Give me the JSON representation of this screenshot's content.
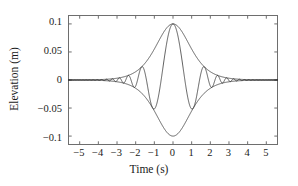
{
  "figure": {
    "background_color": "#ffffff",
    "frame_color": "#6e6e6e",
    "line_color": "#2b2b2b"
  },
  "axis": {
    "xlabel": "Time (s)",
    "ylabel": "Elevation (m)",
    "xticks": [
      "−5",
      "−4",
      "−3",
      "−2",
      "−1",
      "0",
      "1",
      "2",
      "3",
      "4",
      "5"
    ],
    "yticks": [
      "0.1",
      "0.05",
      "0",
      "−0.05",
      "−0.1"
    ]
  },
  "chart_data": {
    "type": "line",
    "title": "",
    "xlabel": "Time (s)",
    "ylabel": "Elevation (m)",
    "xlim": [
      -5.6,
      5.6
    ],
    "ylim": [
      -0.115,
      0.115
    ],
    "xticks": [
      -5,
      -4,
      -3,
      -2,
      -1,
      0,
      1,
      2,
      3,
      4,
      5
    ],
    "yticks": [
      -0.1,
      -0.05,
      0,
      0.05,
      0.1
    ],
    "grid": false,
    "legend": false,
    "series": [
      {
        "name": "upper-envelope",
        "style": "solid",
        "x": [
          -5.6,
          -5.2,
          -4.8,
          -4.4,
          -4.0,
          -3.6,
          -3.2,
          -2.8,
          -2.4,
          -2.0,
          -1.6,
          -1.2,
          -0.8,
          -0.4,
          0.0,
          0.4,
          0.8,
          1.2,
          1.6,
          2.0,
          2.4,
          2.8,
          3.2,
          3.6,
          4.0,
          4.4,
          4.8,
          5.2,
          5.6
        ],
        "y": [
          0.0026,
          0.0035,
          0.0047,
          0.0063,
          0.0085,
          0.0113,
          0.0151,
          0.0199,
          0.0261,
          0.0338,
          0.0431,
          0.0542,
          0.0666,
          0.0793,
          0.1,
          0.0793,
          0.0666,
          0.0542,
          0.0431,
          0.0338,
          0.0261,
          0.0199,
          0.0151,
          0.0113,
          0.0085,
          0.0063,
          0.0047,
          0.0035,
          0.0026
        ]
      },
      {
        "name": "lower-envelope",
        "style": "solid",
        "x": [
          -5.6,
          -5.2,
          -4.8,
          -4.4,
          -4.0,
          -3.6,
          -3.2,
          -2.8,
          -2.4,
          -2.0,
          -1.6,
          -1.2,
          -0.8,
          -0.4,
          0.0,
          0.4,
          0.8,
          1.2,
          1.6,
          2.0,
          2.4,
          2.8,
          3.2,
          3.6,
          4.0,
          4.4,
          4.8,
          5.2,
          5.6
        ],
        "y": [
          -0.0026,
          -0.0035,
          -0.0047,
          -0.0063,
          -0.0085,
          -0.0113,
          -0.0151,
          -0.0199,
          -0.0261,
          -0.0338,
          -0.0431,
          -0.0542,
          -0.0666,
          -0.0793,
          -0.1,
          -0.0793,
          -0.0666,
          -0.0542,
          -0.0431,
          -0.0338,
          -0.0261,
          -0.0199,
          -0.0151,
          -0.0113,
          -0.0085,
          -0.0063,
          -0.0047,
          -0.0035,
          -0.0026
        ]
      },
      {
        "name": "chirped-carrier",
        "style": "solid",
        "envelope_peak": 0.1,
        "envelope_half_width_s": 1.55,
        "chirp_note": "carrier phase ~ k*t*|t| producing period that shortens with |t|",
        "touch_points_s": [
          0.0,
          1.9,
          2.8,
          3.45,
          4.0,
          4.5,
          4.95
        ]
      }
    ]
  }
}
